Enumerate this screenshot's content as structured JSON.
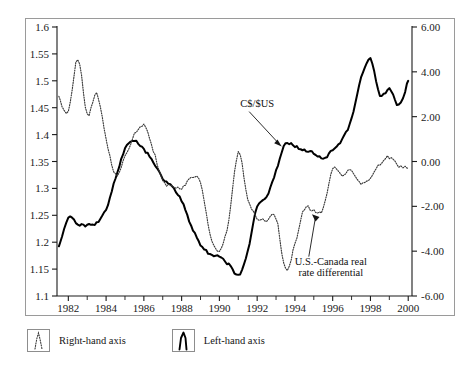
{
  "chart_data": {
    "type": "line",
    "title": "",
    "subtitle": "",
    "xlabel": "",
    "ylabel": "",
    "grid": false,
    "legend_position": "below-left",
    "x": [
      1981.5,
      1982.0,
      1982.5,
      1983.0,
      1983.5,
      1984.0,
      1984.5,
      1985.0,
      1985.5,
      1986.0,
      1986.5,
      1987.0,
      1987.5,
      1988.0,
      1988.5,
      1989.0,
      1989.5,
      1990.0,
      1990.5,
      1991.0,
      1991.5,
      1992.0,
      1992.5,
      1993.0,
      1993.5,
      1994.0,
      1994.5,
      1995.0,
      1995.5,
      1996.0,
      1996.5,
      1997.0,
      1997.5,
      1998.0,
      1998.5,
      1999.0,
      1999.5,
      2000.0
    ],
    "xlim": [
      1981.4,
      2000.2
    ],
    "x_ticks_major": [
      1982,
      1984,
      1986,
      1988,
      1990,
      1992,
      1994,
      1996,
      1998,
      2000
    ],
    "x_tick_labels": [
      "1982",
      "1984",
      "1986",
      "1988",
      "1990",
      "1992",
      "1994",
      "1996",
      "1998",
      "2000"
    ],
    "x_ticks_minor": [
      1983,
      1985,
      1987,
      1989,
      1991,
      1993,
      1995,
      1997,
      1999
    ],
    "left_axis": {
      "name": "C$/$US",
      "lim": [
        1.1,
        1.6
      ],
      "ticks": [
        1.1,
        1.15,
        1.2,
        1.25,
        1.3,
        1.35,
        1.4,
        1.45,
        1.5,
        1.55,
        1.6
      ],
      "tick_labels": [
        "1.1",
        "1.15",
        "1.2",
        "1.25",
        "1.3",
        "1.35",
        "1.4",
        "1.45",
        "1.5",
        "1.55",
        "1.6"
      ]
    },
    "right_axis": {
      "name": "U.S.-Canada real rate differential",
      "lim": [
        -6.0,
        6.0
      ],
      "ticks": [
        -6.0,
        -4.0,
        -2.0,
        0.0,
        2.0,
        4.0,
        6.0
      ],
      "tick_labels": [
        "-6.00",
        "-4.00",
        "-2.00",
        "0.00",
        "2.00",
        "4.00",
        "6.00"
      ]
    },
    "series": [
      {
        "name": "C$/$US",
        "axis": "left",
        "style": "solid-bold",
        "color": "#000000",
        "values": [
          1.19,
          1.245,
          1.232,
          1.232,
          1.236,
          1.262,
          1.318,
          1.372,
          1.388,
          1.372,
          1.35,
          1.318,
          1.303,
          1.278,
          1.232,
          1.196,
          1.178,
          1.172,
          1.158,
          1.138,
          1.184,
          1.265,
          1.285,
          1.332,
          1.382,
          1.378,
          1.372,
          1.366,
          1.355,
          1.372,
          1.392,
          1.43,
          1.505,
          1.54,
          1.472,
          1.485,
          1.455,
          1.5
        ]
      },
      {
        "name": "U.S.-Canada real rate differential",
        "axis": "right",
        "style": "dotted",
        "color": "#3a3a3a",
        "values": [
          2.9,
          2.2,
          4.6,
          2.1,
          3.0,
          1.0,
          -0.6,
          0.2,
          1.2,
          1.6,
          0.5,
          -0.9,
          -1.1,
          -1.2,
          -0.7,
          -1.0,
          -3.2,
          -4.0,
          -2.6,
          0.4,
          -1.7,
          -2.5,
          -2.6,
          -2.5,
          -4.8,
          -3.7,
          -2.1,
          -2.2,
          -2.1,
          -0.3,
          -0.6,
          -0.4,
          -1.0,
          -0.7,
          -0.1,
          0.2,
          -0.2,
          -0.3
        ]
      }
    ],
    "annotations": [
      {
        "id": "annot-cad-usd",
        "text": "C$/$US",
        "text_x": 1992.0,
        "text_y_left": 1.452,
        "arrow_to_x": 1993.3,
        "arrow_to_y_left": 1.378
      },
      {
        "id": "annot-rate-differential",
        "line1": "U.S.-Canada real",
        "line2": "rate differential",
        "text_x": 1995.9,
        "text_y_right": -4.6,
        "arrow_to_x": 1994.9,
        "arrow_to_y_right": -2.35
      }
    ]
  },
  "legend": {
    "items": [
      {
        "id": "legend-right-hand-axis",
        "label": "Right-hand axis",
        "style": "dotted"
      },
      {
        "id": "legend-left-hand-axis",
        "label": "Left-hand axis",
        "style": "solid-bold"
      }
    ]
  },
  "colors": {
    "frame": "#9a9a9a",
    "axis": "#1a1a1a",
    "solid_series": "#000000",
    "dotted_series": "#3a3a3a",
    "background": "#ffffff",
    "text": "#141414"
  },
  "ticks": {
    "left": [
      "1.6",
      "1.55",
      "1.5",
      "1.45",
      "1.4",
      "1.35",
      "1.3",
      "1.25",
      "1.2",
      "1.15",
      "1.1"
    ],
    "right": [
      "6.00",
      "4.00",
      "2.00",
      "0.00",
      "-2.00",
      "-4.00",
      "-6.00"
    ],
    "x": [
      "1982",
      "1984",
      "1986",
      "1988",
      "1990",
      "1992",
      "1994",
      "1996",
      "1998",
      "2000"
    ]
  }
}
